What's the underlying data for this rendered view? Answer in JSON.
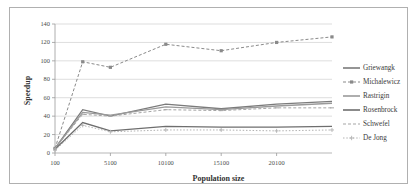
{
  "chart_data": {
    "type": "line",
    "title": "",
    "xlabel": "Population size",
    "ylabel": "Speedup",
    "xlim": [
      100,
      25100
    ],
    "ylim": [
      0,
      140
    ],
    "x_ticks": [
      100,
      5100,
      10100,
      15100,
      20100
    ],
    "x_tick_labels": [
      "100",
      "5100",
      "10100",
      "15100",
      "20100"
    ],
    "y_ticks": [
      0,
      20,
      40,
      60,
      80,
      100,
      120,
      140
    ],
    "y_tick_labels": [
      "0",
      "20",
      "40",
      "60",
      "80",
      "100",
      "120",
      "140"
    ],
    "grid": "horizontal",
    "legend_position": "right",
    "x": [
      100,
      2600,
      5100,
      10100,
      15100,
      20100,
      25100
    ],
    "series": [
      {
        "name": "Griewangk",
        "style": "solid",
        "marker": "none",
        "color": "#7b7b7b",
        "values": [
          5,
          47,
          40,
          53,
          48,
          53,
          56
        ]
      },
      {
        "name": "Michalewicz",
        "style": "dashed",
        "marker": "square",
        "color": "#8a8a8a",
        "values": [
          5,
          99,
          93,
          118,
          111,
          120,
          126
        ]
      },
      {
        "name": "Rastrigin",
        "style": "solid",
        "marker": "none",
        "color": "#9a9a9a",
        "values": [
          5,
          44,
          41,
          50,
          47,
          51,
          54
        ]
      },
      {
        "name": "Rosenbrock",
        "style": "solid",
        "marker": "none",
        "color": "#6e6e6e",
        "values": [
          4,
          33,
          24,
          29,
          28,
          28,
          29
        ]
      },
      {
        "name": "Schwefel",
        "style": "dashed",
        "marker": "dash",
        "color": "#a5a5a5",
        "values": [
          5,
          42,
          40,
          47,
          46,
          49,
          49
        ]
      },
      {
        "name": "De Jong",
        "style": "dotted",
        "marker": "cross",
        "color": "#b3b3b3",
        "values": [
          3,
          30,
          23,
          25,
          25,
          24,
          25
        ]
      }
    ]
  },
  "legend": {
    "entries": [
      {
        "label": "Griewangk"
      },
      {
        "label": "Michalewicz"
      },
      {
        "label": "Rastrigin"
      },
      {
        "label": "Rosenbrock"
      },
      {
        "label": "Schwefel"
      },
      {
        "label": "De Jong"
      }
    ]
  }
}
